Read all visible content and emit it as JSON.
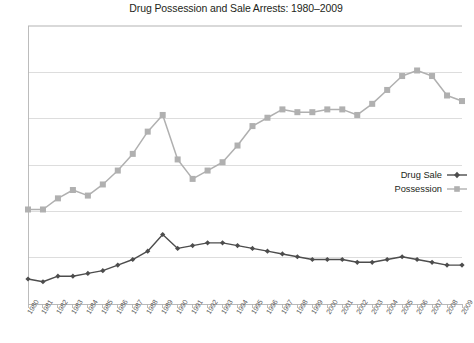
{
  "chart_data": {
    "type": "line",
    "title": "Drug Possession and Sale Arrests: 1980–2009",
    "xlabel": "",
    "ylabel": "",
    "grid": true,
    "gridlines": 7,
    "ytick_labels": [],
    "legend_position": "right",
    "categories": [
      "1980",
      "1981",
      "1982",
      "1983",
      "1984",
      "1985",
      "1986",
      "1987",
      "1988",
      "1989",
      "1990",
      "1991",
      "1992",
      "1993",
      "1994",
      "1995",
      "1996",
      "1997",
      "1998",
      "1999",
      "2000",
      "2001",
      "2002",
      "2003",
      "2004",
      "2005",
      "2006",
      "2007",
      "2008",
      "2009"
    ],
    "series": [
      {
        "name": "Possession",
        "color": "#b0b0b0",
        "marker": "square",
        "values": [
          34,
          34,
          38,
          41,
          39,
          43,
          48,
          54,
          62,
          68,
          52,
          45,
          48,
          51,
          57,
          64,
          67,
          70,
          69,
          69,
          70,
          70,
          68,
          72,
          77,
          82,
          84,
          82,
          75,
          73
        ]
      },
      {
        "name": "Drug Sale",
        "color": "#4d4d4d",
        "marker": "diamond",
        "values": [
          9,
          8,
          10,
          10,
          11,
          12,
          14,
          16,
          19,
          25,
          20,
          21,
          22,
          22,
          21,
          20,
          19,
          18,
          17,
          16,
          16,
          16,
          15,
          15,
          16,
          17,
          16,
          15,
          14,
          14
        ]
      }
    ]
  },
  "legend": {
    "items": [
      {
        "label": "Drug Sale"
      },
      {
        "label": "Possession"
      }
    ]
  },
  "colors": {
    "possession": "#b0b0b0",
    "drug_sale": "#4d4d4d",
    "gridline": "#d9d9d9",
    "axis": "#b5b5b5",
    "text": "#231f20",
    "tick_text": "#5a5a5a"
  }
}
